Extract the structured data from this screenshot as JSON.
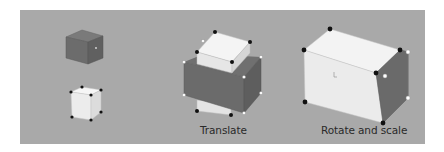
{
  "figure": {
    "background_color": "#ffffff",
    "panel_color": "#a9a9a9",
    "colors": {
      "dark_face_front": "#6e6e6e",
      "dark_face_top": "#7d7d7d",
      "dark_face_side": "#5f5f5f",
      "light_face_front": "#ececec",
      "light_face_top": "#f6f6f6",
      "light_face_side": "#d9d9d9",
      "handle_black": "#111111",
      "handle_white": "#ffffff"
    },
    "panels": [
      {
        "id": "original",
        "label": ""
      },
      {
        "id": "translate",
        "label": "Translate"
      },
      {
        "id": "rotate-scale",
        "label": "Rotate and scale"
      }
    ]
  }
}
